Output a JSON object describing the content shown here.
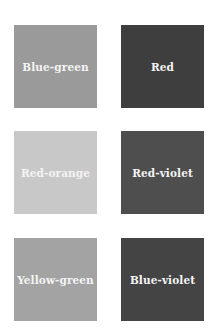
{
  "swatches": [
    {
      "label": "Blue-green",
      "color": "#9a9a9a"
    },
    {
      "label": "Red",
      "color": "#3e3e3e"
    },
    {
      "label": "Red-orange",
      "color": "#c8c8c8"
    },
    {
      "label": "Red-violet",
      "color": "#4e4e4e"
    },
    {
      "label": "Yellow-green",
      "color": "#a3a3a3"
    },
    {
      "label": "Blue-violet",
      "color": "#444444"
    }
  ]
}
